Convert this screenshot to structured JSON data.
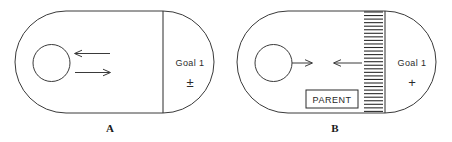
{
  "figure": {
    "background_color": "#ffffff",
    "line_color": "#3a3a3a",
    "text_color": "#2b2b2b"
  },
  "panels": [
    {
      "id": "A",
      "label": "A",
      "goal_label": "Goal 1",
      "goal_symbol": "±",
      "arrows": [
        {
          "name": "approach-arrow",
          "direction": "left"
        },
        {
          "name": "avoid-arrow",
          "direction": "right"
        }
      ],
      "has_barrier": false,
      "barrier_label": ""
    },
    {
      "id": "B",
      "label": "B",
      "goal_label": "Goal 1",
      "goal_symbol": "+",
      "arrows": [
        {
          "name": "approach-arrow",
          "direction": "right"
        },
        {
          "name": "barrier-resistance-arrow",
          "direction": "left"
        }
      ],
      "has_barrier": true,
      "barrier_label": "PARENT"
    }
  ]
}
